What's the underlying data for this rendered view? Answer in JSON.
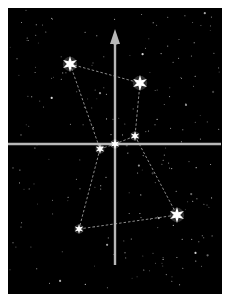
{
  "diagram": {
    "title": "",
    "colors": {
      "background": "#000000",
      "frame": "#ffffff",
      "axis": "#b8b8b8",
      "link": "#8c8c8c",
      "star": "#ffffff"
    },
    "axes": {
      "horizontal": {
        "arrow": false
      },
      "vertical": {
        "arrow": true,
        "arrow_direction": "up"
      }
    },
    "stars": [
      {
        "id": "upper-left",
        "magnitude": "bright"
      },
      {
        "id": "upper-right",
        "magnitude": "bright"
      },
      {
        "id": "belt-right",
        "magnitude": "dim"
      },
      {
        "id": "belt-center",
        "magnitude": "dim"
      },
      {
        "id": "belt-left",
        "magnitude": "dim"
      },
      {
        "id": "lower-right",
        "magnitude": "bright"
      },
      {
        "id": "lower-left",
        "magnitude": "dim"
      }
    ],
    "links": [
      [
        "upper-left",
        "upper-right"
      ],
      [
        "upper-left",
        "belt-left"
      ],
      [
        "upper-right",
        "belt-right"
      ],
      [
        "belt-left",
        "belt-center"
      ],
      [
        "belt-center",
        "belt-right"
      ],
      [
        "belt-left",
        "lower-left"
      ],
      [
        "belt-right",
        "lower-right"
      ],
      [
        "lower-left",
        "lower-right"
      ]
    ],
    "background_star_count": 220
  }
}
